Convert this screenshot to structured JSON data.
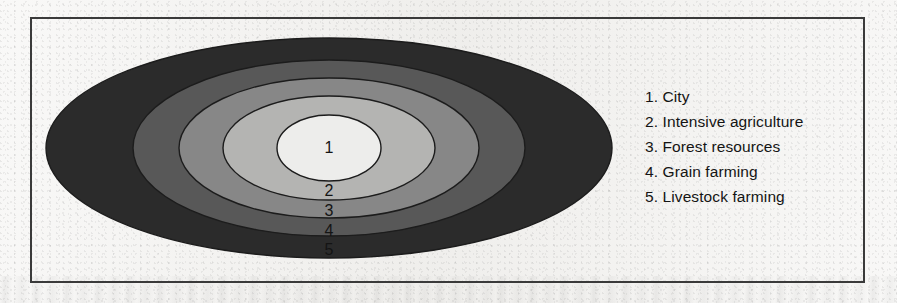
{
  "figure": {
    "type": "concentric-zone-diagram",
    "frame": {
      "border_color": "#3a3a3a"
    },
    "background_color": "#f3f2f0"
  },
  "legend": {
    "items": [
      {
        "number": "1.",
        "label": "City",
        "text": "1. City"
      },
      {
        "number": "2.",
        "label": "Intensive agriculture",
        "text": "2. Intensive agriculture"
      },
      {
        "number": "3.",
        "label": "Forest resources",
        "text": "3. Forest resources"
      },
      {
        "number": "4.",
        "label": "Grain farming",
        "text": "4. Grain farming"
      },
      {
        "number": "5.",
        "label": "Livestock farming",
        "text": "5. Livestock farming"
      }
    ]
  },
  "chart_data": {
    "type": "pie",
    "title": "",
    "subtitle": "",
    "xlabel": "",
    "ylabel": "",
    "legend_position": "right",
    "grid": false,
    "categories": [
      "City",
      "Intensive agriculture",
      "Forest resources",
      "Grain farming",
      "Livestock farming"
    ],
    "series": [
      {
        "name": "Concentric land-use rings (outer semi-axis in px)",
        "values": [
          52,
          106,
          150,
          196,
          283
        ]
      }
    ],
    "rings": [
      {
        "id": "1",
        "label": "City",
        "fill": "#ededeb",
        "stroke": "#1c1c1c",
        "rx": 52,
        "ry": 33
      },
      {
        "id": "2",
        "label": "Intensive agriculture",
        "fill": "#b4b4b2",
        "stroke": "#1c1c1c",
        "rx": 106,
        "ry": 52
      },
      {
        "id": "3",
        "label": "Forest resources",
        "fill": "#878787",
        "stroke": "#1c1c1c",
        "rx": 150,
        "ry": 70
      },
      {
        "id": "4",
        "label": "Grain farming",
        "fill": "#585858",
        "stroke": "#1c1c1c",
        "rx": 196,
        "ry": 88
      },
      {
        "id": "5",
        "label": "Livestock farming",
        "fill": "#2b2b2b",
        "stroke": "#1c1c1c",
        "rx": 283,
        "ry": 110
      }
    ],
    "center": {
      "cx": 329,
      "cy": 148
    },
    "ring_number_labels": [
      {
        "id": "1",
        "x": 329,
        "y": 153
      },
      {
        "id": "2",
        "x": 329,
        "y": 196
      },
      {
        "id": "3",
        "x": 329,
        "y": 216
      },
      {
        "id": "4",
        "x": 329,
        "y": 236
      },
      {
        "id": "5",
        "x": 329,
        "y": 255
      }
    ]
  }
}
